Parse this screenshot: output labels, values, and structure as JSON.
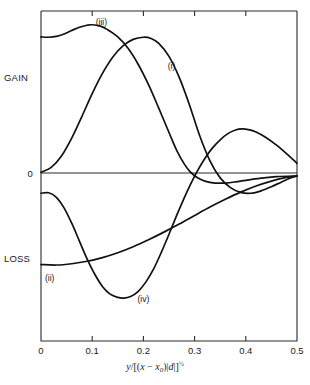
{
  "chart_data": {
    "type": "line",
    "title": "",
    "subtitle": "",
    "xlabel_plain": "y/[(x - x0)|d|]^(1/2)",
    "xlabel_parts": {
      "num": "y",
      "slash": "/[(",
      "var_x": "x",
      "minus": " − ",
      "var_x0": "x",
      "sub0": "0",
      "close_paren": ")|",
      "var_d": "d",
      "close": "|]",
      "exponent": "½"
    },
    "ylabel_top": "GAIN",
    "ylabel_zero": "0",
    "ylabel_bottom": "LOSS",
    "xlim": [
      0,
      0.5
    ],
    "xticks": [
      0,
      0.1,
      0.2,
      0.3,
      0.4,
      0.5
    ],
    "xticklabels": [
      "0",
      "0.1",
      "0.2",
      "0.3",
      "0.4",
      "0.5"
    ],
    "ticks_on_top": true,
    "grid": false,
    "legend": "inline-annotations",
    "ylim": [
      -1.0,
      1.0
    ],
    "yticks": [
      0
    ],
    "zero_line": true,
    "series": [
      {
        "name": "(i)",
        "label": "(i)",
        "label_x": 0.255,
        "label_y": 0.64,
        "points": [
          [
            0.0,
            0.005
          ],
          [
            0.02,
            0.035
          ],
          [
            0.04,
            0.105
          ],
          [
            0.06,
            0.215
          ],
          [
            0.08,
            0.35
          ],
          [
            0.1,
            0.49
          ],
          [
            0.12,
            0.615
          ],
          [
            0.14,
            0.715
          ],
          [
            0.16,
            0.785
          ],
          [
            0.18,
            0.825
          ],
          [
            0.2,
            0.838
          ],
          [
            0.215,
            0.83
          ],
          [
            0.23,
            0.8
          ],
          [
            0.25,
            0.72
          ],
          [
            0.27,
            0.59
          ],
          [
            0.29,
            0.42
          ],
          [
            0.31,
            0.23
          ],
          [
            0.33,
            0.075
          ],
          [
            0.35,
            -0.03
          ],
          [
            0.37,
            -0.09
          ],
          [
            0.39,
            -0.12
          ],
          [
            0.41,
            -0.125
          ],
          [
            0.43,
            -0.11
          ],
          [
            0.45,
            -0.085
          ],
          [
            0.47,
            -0.055
          ],
          [
            0.49,
            -0.028
          ],
          [
            0.5,
            -0.018
          ]
        ]
      },
      {
        "name": "(ii)",
        "label": "(ii)",
        "label_x": 0.017,
        "label_y": -0.665,
        "points": [
          [
            0.0,
            -0.565
          ],
          [
            0.03,
            -0.568
          ],
          [
            0.06,
            -0.56
          ],
          [
            0.09,
            -0.545
          ],
          [
            0.12,
            -0.522
          ],
          [
            0.15,
            -0.492
          ],
          [
            0.18,
            -0.455
          ],
          [
            0.21,
            -0.412
          ],
          [
            0.24,
            -0.365
          ],
          [
            0.27,
            -0.315
          ],
          [
            0.3,
            -0.262
          ],
          [
            0.33,
            -0.21
          ],
          [
            0.36,
            -0.162
          ],
          [
            0.39,
            -0.118
          ],
          [
            0.42,
            -0.08
          ],
          [
            0.45,
            -0.05
          ],
          [
            0.475,
            -0.03
          ],
          [
            0.5,
            -0.018
          ]
        ]
      },
      {
        "name": "(iii)",
        "label": "(iii)",
        "label_x": 0.118,
        "label_y": 0.915,
        "points": [
          [
            0.0,
            0.84
          ],
          [
            0.015,
            0.838
          ],
          [
            0.03,
            0.843
          ],
          [
            0.045,
            0.858
          ],
          [
            0.06,
            0.88
          ],
          [
            0.075,
            0.9
          ],
          [
            0.09,
            0.912
          ],
          [
            0.1,
            0.915
          ],
          [
            0.115,
            0.908
          ],
          [
            0.13,
            0.885
          ],
          [
            0.15,
            0.84
          ],
          [
            0.17,
            0.77
          ],
          [
            0.19,
            0.67
          ],
          [
            0.21,
            0.545
          ],
          [
            0.23,
            0.4
          ],
          [
            0.25,
            0.25
          ],
          [
            0.265,
            0.14
          ],
          [
            0.28,
            0.055
          ],
          [
            0.292,
            0.005
          ],
          [
            0.305,
            -0.028
          ],
          [
            0.32,
            -0.05
          ],
          [
            0.34,
            -0.062
          ],
          [
            0.36,
            -0.062
          ],
          [
            0.38,
            -0.055
          ],
          [
            0.4,
            -0.045
          ],
          [
            0.43,
            -0.032
          ],
          [
            0.46,
            -0.022
          ],
          [
            0.5,
            -0.018
          ]
        ]
      },
      {
        "name": "(iv)",
        "label": "(iv)",
        "label_x": 0.2,
        "label_y": -0.795,
        "points": [
          [
            0.0,
            -0.125
          ],
          [
            0.015,
            -0.122
          ],
          [
            0.03,
            -0.15
          ],
          [
            0.045,
            -0.215
          ],
          [
            0.06,
            -0.31
          ],
          [
            0.075,
            -0.42
          ],
          [
            0.09,
            -0.53
          ],
          [
            0.105,
            -0.625
          ],
          [
            0.12,
            -0.7
          ],
          [
            0.135,
            -0.748
          ],
          [
            0.15,
            -0.768
          ],
          [
            0.162,
            -0.772
          ],
          [
            0.175,
            -0.762
          ],
          [
            0.19,
            -0.73
          ],
          [
            0.205,
            -0.672
          ],
          [
            0.22,
            -0.592
          ],
          [
            0.235,
            -0.49
          ],
          [
            0.25,
            -0.378
          ],
          [
            0.265,
            -0.262
          ],
          [
            0.28,
            -0.152
          ],
          [
            0.292,
            -0.07
          ],
          [
            0.305,
            0.01
          ],
          [
            0.32,
            0.09
          ],
          [
            0.335,
            0.155
          ],
          [
            0.35,
            0.205
          ],
          [
            0.365,
            0.243
          ],
          [
            0.38,
            0.265
          ],
          [
            0.392,
            0.272
          ],
          [
            0.405,
            0.268
          ],
          [
            0.42,
            0.253
          ],
          [
            0.44,
            0.218
          ],
          [
            0.46,
            0.172
          ],
          [
            0.48,
            0.118
          ],
          [
            0.5,
            0.06
          ]
        ]
      }
    ]
  },
  "plot_geometry": {
    "left": 41,
    "right": 297,
    "top": 11,
    "bottom": 341,
    "zero_y": 173
  }
}
